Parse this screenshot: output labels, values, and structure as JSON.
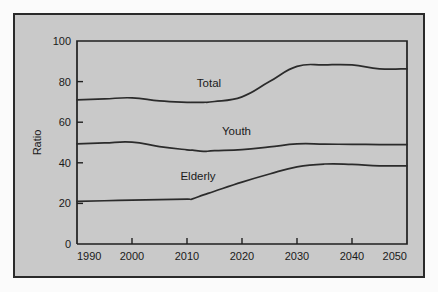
{
  "chart_data": {
    "type": "line",
    "title": "",
    "subtitle": "",
    "xlabel": "",
    "ylabel": "Ratio",
    "xlim": [
      1990,
      2050
    ],
    "ylim": [
      0,
      100
    ],
    "xticks": [
      "1990",
      "2000",
      "2010",
      "2020",
      "2030",
      "2040",
      "2050"
    ],
    "yticks": [
      "0",
      "20",
      "40",
      "60",
      "80",
      "100"
    ],
    "grid": false,
    "legend_position": "inline-labels",
    "x": [
      1990,
      1995,
      2000,
      2005,
      2010,
      2011,
      2013,
      2015,
      2020,
      2025,
      2030,
      2035,
      2040,
      2045,
      2050
    ],
    "series": [
      {
        "name": "Total",
        "label": "Total",
        "values": [
          71.0,
          71.5,
          72.0,
          70.5,
          69.8,
          69.8,
          69.8,
          70.2,
          72.5,
          80.0,
          87.5,
          88.2,
          88.2,
          86.3,
          86.3
        ]
      },
      {
        "name": "Youth",
        "label": "Youth",
        "values": [
          49.3,
          49.8,
          50.2,
          48.0,
          46.4,
          46.2,
          45.6,
          46.0,
          46.5,
          47.8,
          49.3,
          49.2,
          49.1,
          49.0,
          49.0
        ]
      },
      {
        "name": "Elderly",
        "label": "Elderly",
        "values": [
          21.0,
          21.3,
          21.6,
          21.9,
          22.1,
          22.2,
          24.2,
          26.0,
          30.5,
          34.5,
          38.0,
          39.4,
          39.2,
          38.5,
          38.5
        ]
      }
    ],
    "annotations": [
      {
        "text": "Total",
        "x": 2014,
        "y": 77.5
      },
      {
        "text": "Youth",
        "x": 2019,
        "y": 53.5
      },
      {
        "text": "Elderly",
        "x": 2012,
        "y": 31.5
      }
    ],
    "colors": {
      "panel_background": "#c9c9c9",
      "figure_background": "#fbfbfb",
      "line": "#2b2b2b",
      "axis": "#1f1f1f",
      "text": "#1a1a1a",
      "border": "#2a2a2a"
    }
  }
}
